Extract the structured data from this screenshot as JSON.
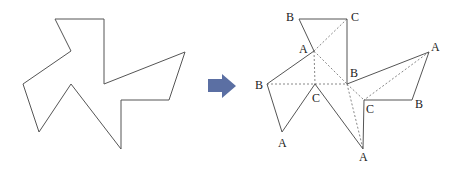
{
  "diagram": {
    "colors": {
      "line": "#555555",
      "dashed": "#888888",
      "arrow": "#5b6fa3",
      "label": "#222222"
    },
    "left_shape": {
      "points": [
        [
          55,
          19
        ],
        [
          104,
          19
        ],
        [
          104,
          84
        ],
        [
          185,
          52
        ],
        [
          169,
          100
        ],
        [
          121,
          100
        ],
        [
          121,
          149
        ],
        [
          71,
          84
        ],
        [
          39,
          132
        ],
        [
          23,
          84
        ],
        [
          71,
          51
        ]
      ]
    },
    "arrow": {
      "direction": "right"
    },
    "right_shape": {
      "outline": [
        [
          299,
          19
        ],
        [
          347,
          19
        ],
        [
          347,
          84
        ],
        [
          429,
          52
        ],
        [
          412,
          100
        ],
        [
          364,
          100
        ],
        [
          363,
          149
        ],
        [
          315,
          84
        ],
        [
          282,
          132
        ],
        [
          267,
          84
        ],
        [
          314,
          51
        ]
      ],
      "dashed_lines": [
        [
          [
            314,
            51
          ],
          [
            347,
            19
          ]
        ],
        [
          [
            314,
            51
          ],
          [
            315,
            84
          ]
        ],
        [
          [
            314,
            51
          ],
          [
            347,
            84
          ]
        ],
        [
          [
            267,
            84
          ],
          [
            347,
            84
          ]
        ],
        [
          [
            347,
            84
          ],
          [
            364,
            100
          ]
        ],
        [
          [
            347,
            84
          ],
          [
            363,
            149
          ]
        ],
        [
          [
            429,
            52
          ],
          [
            364,
            100
          ]
        ]
      ],
      "labels": [
        {
          "text": "B",
          "x": 286,
          "y": 21
        },
        {
          "text": "C",
          "x": 351,
          "y": 21
        },
        {
          "text": "A",
          "x": 299,
          "y": 53
        },
        {
          "text": "B",
          "x": 350,
          "y": 77
        },
        {
          "text": "B",
          "x": 255,
          "y": 89
        },
        {
          "text": "C",
          "x": 312,
          "y": 102
        },
        {
          "text": "A",
          "x": 278,
          "y": 147
        },
        {
          "text": "C",
          "x": 366,
          "y": 113
        },
        {
          "text": "B",
          "x": 415,
          "y": 108
        },
        {
          "text": "A",
          "x": 431,
          "y": 51
        },
        {
          "text": "A",
          "x": 359,
          "y": 161
        }
      ]
    }
  }
}
